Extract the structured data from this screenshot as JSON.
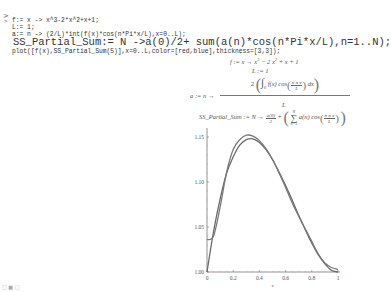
{
  "worksheet": {
    "prompt_marker": ">",
    "prompt_caret": ">",
    "input_lines": [
      "f:= x -> x^3-2*x^2+x+1;",
      "L:= 1;",
      "a:= n -> (2/L)*int(f(x)*cos(n*Pi*x/L),x=0..L);",
      "SS_Partial_Sum:= N ->a(0)/2+ sum(a(n)*cos(n*Pi*x/L),n=1..N);",
      "plot([f(x),SS_Partial_Sum(5)],x=0..L,color=[red,blue],thickness=[3,3]);"
    ]
  },
  "outputs": {
    "f_def": {
      "lhs": "f",
      "arrow": ":= x → x",
      "rest": "− 2 x",
      "tail": "+ x + 1",
      "exp3": "3",
      "exp2": "2"
    },
    "L_def": "L := 1",
    "a_def": {
      "lhs": "a := n →",
      "numer_coef": "2",
      "integrand": "f(x) cos",
      "arg_num": "n π x",
      "arg_den": "L",
      "dx": "dx",
      "lower": "0",
      "upper": "L",
      "denom": "L"
    },
    "ss_def": {
      "lhs": "SS_Partial_Sum := N →",
      "a0_num": "a(0)",
      "a0_den": "2",
      "plus": "+",
      "sum_top": "N",
      "sum_bot": "n=1",
      "term": "a(n) cos",
      "arg_num": "n π x",
      "arg_den": "L"
    }
  },
  "status_bar": {
    "text": "□ ■ □"
  },
  "chart_data": {
    "type": "line",
    "title": "",
    "xlabel": "x",
    "ylabel": "",
    "xlim": [
      0,
      1
    ],
    "ylim": [
      1.0,
      1.155
    ],
    "x_ticks": [
      "0",
      "0.2",
      "0.4",
      "0.6",
      "0.8",
      "1"
    ],
    "y_ticks": [
      "1.00",
      "1.05",
      "1.10",
      "1.15"
    ],
    "grid": false,
    "legend": "none",
    "x": [
      0,
      0.05,
      0.1,
      0.15,
      0.2,
      0.25,
      0.3,
      0.35,
      0.4,
      0.45,
      0.5,
      0.55,
      0.6,
      0.65,
      0.7,
      0.75,
      0.8,
      0.85,
      0.9,
      0.95,
      1.0
    ],
    "series": [
      {
        "name": "f(x)",
        "color": "red",
        "thickness": 3,
        "values": [
          1.0,
          1.045,
          1.081,
          1.11,
          1.128,
          1.141,
          1.147,
          1.148,
          1.144,
          1.136,
          1.125,
          1.111,
          1.096,
          1.08,
          1.063,
          1.047,
          1.032,
          1.019,
          1.009,
          1.002,
          1.0
        ]
      },
      {
        "name": "SS_Partial_Sum(5)",
        "color": "blue",
        "thickness": 3,
        "values": [
          1.036,
          1.04,
          1.072,
          1.111,
          1.136,
          1.147,
          1.152,
          1.151,
          1.146,
          1.137,
          1.125,
          1.11,
          1.094,
          1.077,
          1.062,
          1.048,
          1.034,
          1.02,
          1.01,
          1.005,
          1.003
        ]
      }
    ]
  }
}
